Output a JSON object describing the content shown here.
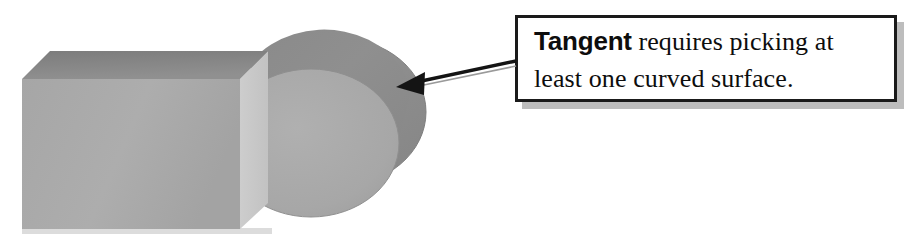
{
  "canvas": {
    "width": 918,
    "height": 239,
    "background": "#ffffff"
  },
  "callout": {
    "text_full": "Tangent requires picking at least one curved surface.",
    "keyword": "Tangent",
    "line1_rest": " requires picking at",
    "line2": "least one curved surface.",
    "border_color": "#1a1a1a",
    "shadow_color": "#bdbdbd",
    "fill_color": "#ffffff",
    "text_color": "#0d0d0d"
  },
  "annotation": {
    "arrow_color": "#141414",
    "arrow_from": {
      "x": 515,
      "y": 62
    },
    "arrow_to": {
      "x": 398,
      "y": 86
    },
    "points_at": "cylinder-curved-surface"
  },
  "scene": {
    "description": "Isometric grey box adjacent to a grey cylinder",
    "objects": [
      {
        "name": "box",
        "shape": "rectangular-prism",
        "top_face_color": "#858585",
        "front_face_color": "#ababab",
        "side_face_color": "#c9c9c9",
        "shadow_color": "#d6d6d6"
      },
      {
        "name": "cylinder",
        "shape": "cylinder",
        "body_color": "#8d8d8d",
        "front_cap_color": "#a9a9a9",
        "edge_color": "#7c7c7c"
      }
    ]
  }
}
